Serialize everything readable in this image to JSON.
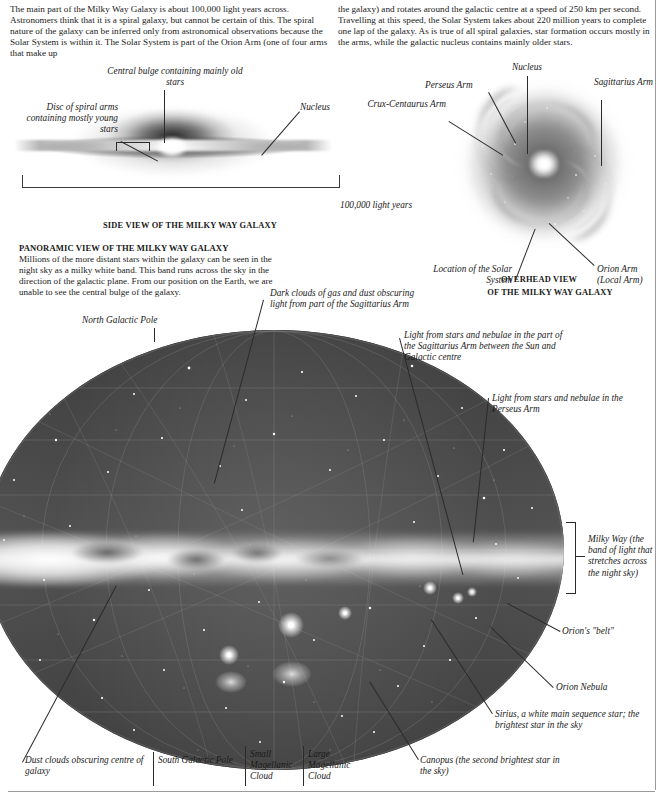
{
  "intro": {
    "column_1": "The main part of the Milky Way Galaxy is about 100,000 light years across. Astronomers think that it is a spiral galaxy, but cannot be certain of this. The spiral nature of the galaxy can be inferred only from astronomical observations because the Solar System is within it. The Solar System is part of the Orion Arm (one of four arms that make up",
    "column_2": "the galaxy) and rotates around the galactic centre at a speed of 250 km per second. Travelling at this speed, the Solar System takes about 220 million years to complete one lap of the galaxy. As is true of all spiral galaxies, star formation occurs mostly in the arms, while the galactic nucleus contains mainly older stars."
  },
  "side_view": {
    "caption": "SIDE VIEW OF THE MILKY WAY GALAXY",
    "label_bulge": "Central bulge containing mainly old stars",
    "label_disc": "Disc of spiral arms containing mostly young stars",
    "label_nucleus": "Nucleus",
    "scale_label": "100,000 light years"
  },
  "overhead_view": {
    "caption_line_1": "OVERHEAD VIEW",
    "caption_line_2": "OF THE MILKY WAY GALAXY",
    "label_nucleus": "Nucleus",
    "label_perseus_arm": "Perseus Arm",
    "label_sagittarius_arm": "Sagittarius Arm",
    "label_crux_centaurus_arm": "Crux-Centaurus Arm",
    "label_solar_system": "Location of the Solar System",
    "label_orion_arm": "Orion Arm (Local Arm)"
  },
  "panoramic": {
    "heading": "PANORAMIC VIEW OF THE MILKY WAY GALAXY",
    "text": "Millions of the more distant stars within the galaxy can be seen in the night sky as a milky white band. This band runs across the sky in the direction of the galactic plane. From our position on the Earth, we are unable to see the central bulge of the galaxy.",
    "label_north_pole": "North Galactic Pole",
    "label_dark_clouds": "Dark clouds of gas and dust obscuring light from part of the Sagittarius Arm",
    "label_sagittarius_light": "Light from stars and nebulae in the part of the Sagittarius Arm between the Sun and Galactic centre",
    "label_perseus_light": "Light from stars and nebulae in the Perseus Arm",
    "label_milky_way_band": "Milky Way (the band of light that stretches across the night sky)",
    "label_orions_belt": "Orion's \"belt\"",
    "label_orion_nebula": "Orion Nebula",
    "label_sirius": "Sirius, a white main sequence star; the brightest star in the sky",
    "label_canopus": "Canopus (the second brightest star in the sky)",
    "label_dust_clouds": "Dust clouds obscuring centre of galaxy",
    "label_south_pole": "South Galactic Pole",
    "label_smc": "Small Magellanic Cloud",
    "label_lmc": "Large Magellanic Cloud"
  },
  "colors": {
    "ink": "#1a1a1a",
    "leader": "#2b2b2b",
    "rule": "#9a9a9a",
    "sky": "#4d4d4d",
    "band": "#ffffff"
  }
}
